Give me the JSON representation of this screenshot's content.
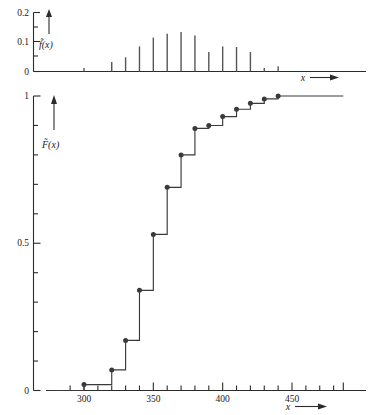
{
  "figure": {
    "background": "#ffffff",
    "ink_color": "#2b2b2b"
  },
  "chart_data": [
    {
      "type": "bar",
      "id": "empirical-pmf",
      "title": "",
      "xlabel": "x",
      "ylabel": "f̃(x)",
      "ylim": [
        0,
        0.2
      ],
      "xlim": [
        280,
        490
      ],
      "grid": false,
      "legend": null,
      "ytick_values": [
        0,
        0.1,
        0.2
      ],
      "ytick_labels": [
        "0",
        "0.1",
        "0.2"
      ],
      "yminor_values": [
        0.05,
        0.15
      ],
      "categories": [
        300,
        310,
        320,
        330,
        340,
        350,
        360,
        370,
        380,
        390,
        400,
        410,
        420,
        430,
        440
      ],
      "values": [
        0.012,
        0.0,
        0.032,
        0.048,
        0.085,
        0.115,
        0.128,
        0.134,
        0.122,
        0.066,
        0.085,
        0.083,
        0.066,
        0.012,
        0.018
      ],
      "x_arrow_label": "x"
    },
    {
      "type": "line",
      "id": "empirical-cdf",
      "title": "",
      "xlabel": "x",
      "ylabel": "F̃(x)",
      "ylim": [
        0,
        1
      ],
      "xlim": [
        280,
        490
      ],
      "grid": false,
      "legend": null,
      "ytick_values": [
        0,
        0.5,
        1
      ],
      "ytick_labels": [
        "0",
        "0.5",
        "1"
      ],
      "yminor_values": [
        0.1,
        0.2,
        0.3,
        0.4,
        0.6,
        0.7,
        0.8,
        0.9
      ],
      "xtick_values": [
        300,
        350,
        400,
        450
      ],
      "xtick_labels": [
        "300",
        "350",
        "400",
        "450"
      ],
      "xminor_values": [
        290,
        310,
        320,
        330,
        340,
        360,
        370,
        380,
        390,
        410,
        420,
        430,
        440,
        460,
        470,
        480
      ],
      "x": [
        300,
        320,
        330,
        340,
        350,
        360,
        370,
        380,
        390,
        400,
        410,
        420,
        430,
        440
      ],
      "y": [
        0.02,
        0.07,
        0.17,
        0.34,
        0.53,
        0.69,
        0.8,
        0.89,
        0.9,
        0.93,
        0.955,
        0.975,
        0.99,
        1.0
      ],
      "step_mode": "post",
      "marker": "filled-circle",
      "x_arrow_label": "x"
    }
  ],
  "labels": {
    "pmf_y_axis": "f̃(x)",
    "cdf_y_axis": "F̃(x)",
    "x_axis": "x"
  }
}
